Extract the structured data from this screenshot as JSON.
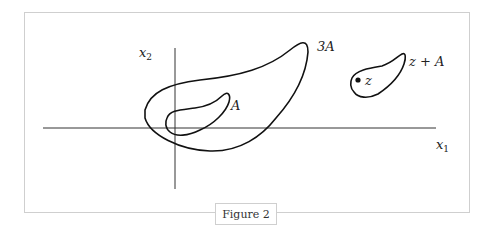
{
  "figure": {
    "caption": "Figure 2",
    "axes": {
      "x_label_var": "x",
      "x_label_sub": "1",
      "y_label_var": "x",
      "y_label_sub": "2"
    },
    "sets": [
      {
        "label": "A"
      },
      {
        "label": "3A"
      },
      {
        "label": "z + A"
      }
    ],
    "point": {
      "label": "z"
    }
  }
}
